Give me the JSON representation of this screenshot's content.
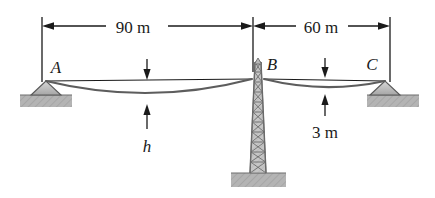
{
  "figure": {
    "type": "statics-cable-diagram",
    "background_color": "#ffffff",
    "line_color": "#1a1a1a",
    "cable_color": "#555555",
    "ground_fill": "#b0b0b0",
    "support_fill": "#b8b8b8",
    "tower_fill": "#c9c9c9"
  },
  "dimensions": [
    {
      "id": "span-left",
      "label": "90 m",
      "from_point": "A",
      "to_point": "B",
      "label_x": 133,
      "label_y": 31
    },
    {
      "id": "span-right",
      "label": "60 m",
      "from_point": "B",
      "to_point": "C",
      "label_x": 321,
      "label_y": 31
    },
    {
      "id": "sag-left",
      "label": "h",
      "italic": true,
      "label_x": 147,
      "label_y": 147
    },
    {
      "id": "sag-right",
      "label": "3 m",
      "italic": false,
      "label_x": 328,
      "label_y": 132
    }
  ],
  "points": [
    {
      "id": "A",
      "label": "A",
      "label_x": 56,
      "label_y": 73,
      "support": "pin"
    },
    {
      "id": "B",
      "label": "B",
      "label_x": 270,
      "label_y": 70,
      "support": "tower"
    },
    {
      "id": "C",
      "label": "C",
      "label_x": 371,
      "label_y": 70,
      "support": "pin"
    }
  ]
}
